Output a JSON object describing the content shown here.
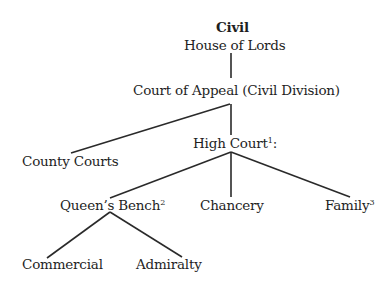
{
  "diagram": {
    "title": "Civil",
    "nodes": {
      "house_of_lords": {
        "label": "House of Lords",
        "sup": ""
      },
      "court_of_appeal": {
        "label": "Court of Appeal (Civil Division)",
        "sup": ""
      },
      "county_courts": {
        "label": "County Courts",
        "sup": ""
      },
      "high_court": {
        "label": "High Court",
        "sup": "1",
        "suffix": ":"
      },
      "queens_bench": {
        "label": "Queen’s Bench",
        "sup": "2"
      },
      "chancery": {
        "label": "Chancery",
        "sup": ""
      },
      "family": {
        "label": "Family",
        "sup": "3"
      },
      "commercial": {
        "label": "Commercial",
        "sup": ""
      },
      "admiralty": {
        "label": "Admiralty",
        "sup": ""
      }
    },
    "edges": [
      [
        "house_of_lords",
        "court_of_appeal"
      ],
      [
        "court_of_appeal",
        "county_courts"
      ],
      [
        "court_of_appeal",
        "high_court"
      ],
      [
        "high_court",
        "queens_bench"
      ],
      [
        "high_court",
        "chancery"
      ],
      [
        "high_court",
        "family"
      ],
      [
        "queens_bench",
        "commercial"
      ],
      [
        "queens_bench",
        "admiralty"
      ]
    ]
  }
}
